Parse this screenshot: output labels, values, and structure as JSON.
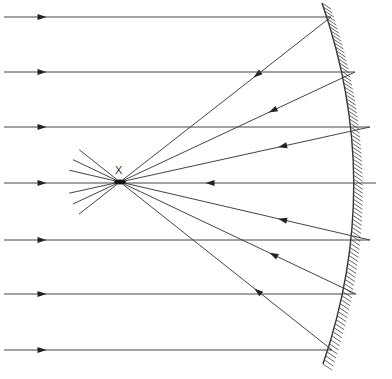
{
  "diagram": {
    "title": "",
    "type": "concave-mirror-ray-diagram",
    "focus": {
      "label": "X",
      "x": 120,
      "y": 182
    },
    "colors": {
      "ray": "#444444",
      "mirror": "#333333",
      "hatch": "#555555",
      "background": "#ffffff"
    },
    "rays": [
      {
        "y": 17,
        "hit_x": 331
      },
      {
        "y": 72,
        "hit_x": 355
      },
      {
        "y": 127,
        "hit_x": 370
      },
      {
        "y": 183,
        "hit_x": 376
      },
      {
        "y": 240,
        "hit_x": 370
      },
      {
        "y": 294,
        "hit_x": 356
      },
      {
        "y": 350,
        "hit_x": 332
      }
    ],
    "mirror": {
      "type": "concave",
      "hatching": "right-side"
    }
  }
}
